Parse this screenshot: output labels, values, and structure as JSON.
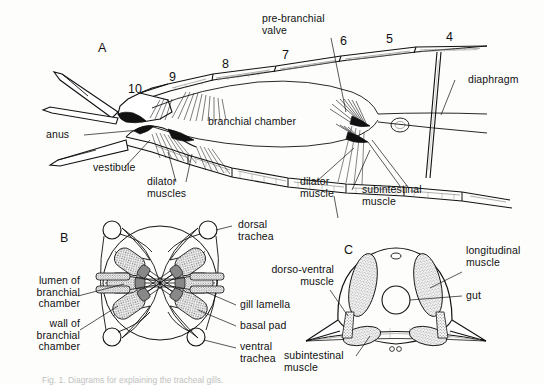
{
  "figure": {
    "background_color": "#fdfdfc",
    "ink_color": "#111111",
    "caption": "Fig. 1. Diagrams for explaining the tracheal gills."
  },
  "panels": [
    {
      "id": "A",
      "letter": "A",
      "description": "lateral view of abdomen showing branchial chamber"
    },
    {
      "id": "B",
      "letter": "B",
      "description": "transverse section through branchial chamber with radial gill lamellae"
    },
    {
      "id": "C",
      "letter": "C",
      "description": "transverse section of abdomen showing musculature and gut"
    }
  ],
  "panel_a": {
    "letter": "A",
    "segment_numbers": [
      "10",
      "9",
      "8",
      "7",
      "6",
      "5",
      "4"
    ],
    "labels": {
      "pre_branchial_valve": "pre-branchial\nvalve",
      "diaphragm": "diaphragm",
      "branchial_chamber": "branchial chamber",
      "anus": "anus",
      "vestibule": "vestibule",
      "dilator_muscles": "dilator\nmuscles",
      "dilator_muscle": "dilator\nmuscle",
      "subintestinal_muscle": "subintestinal\nmuscle"
    }
  },
  "panel_b": {
    "letter": "B",
    "labels": {
      "dorsal_trachea": "dorsal\ntrachea",
      "lumen_of_branchial_chamber": "lumen of\nbranchial\nchamber",
      "wall_of_branchial_chamber": "wall of\nbranchial\nchamber",
      "gill_lamella": "gill lamella",
      "basal_pad": "basal pad",
      "ventral_trachea": "ventral\ntrachea",
      "dilator_muscle": "dilator\nmuscle"
    }
  },
  "panel_c": {
    "letter": "C",
    "labels": {
      "longitudinal_muscle": "longitudinal\nmuscle",
      "gut": "gut",
      "dorso_ventral_muscle": "dorso-ventral\nmuscle",
      "subintestinal_muscle": "subintestinal\nmuscle",
      "subintestinal_muscle_top": "subintestinal\nmuscle"
    }
  }
}
